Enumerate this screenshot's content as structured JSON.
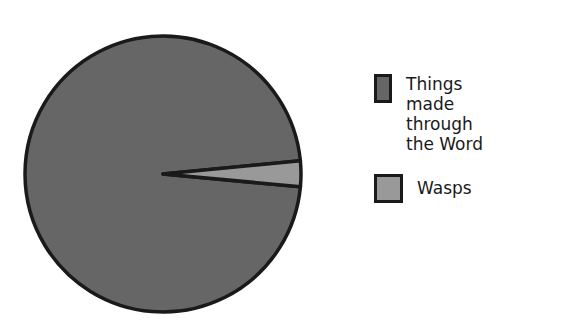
{
  "chart_data": {
    "type": "pie",
    "title": "",
    "categories": [
      "Things made through the Word",
      "Wasps"
    ],
    "values": [
      97,
      3
    ],
    "colors": [
      "#666666",
      "#999999"
    ],
    "start_angle_deg": -5.5,
    "legend_position": "right"
  },
  "legend": {
    "items": [
      {
        "label": "Things made\nthrough the Word",
        "color": "#666666"
      },
      {
        "label": "Wasps",
        "color": "#999999"
      }
    ]
  }
}
